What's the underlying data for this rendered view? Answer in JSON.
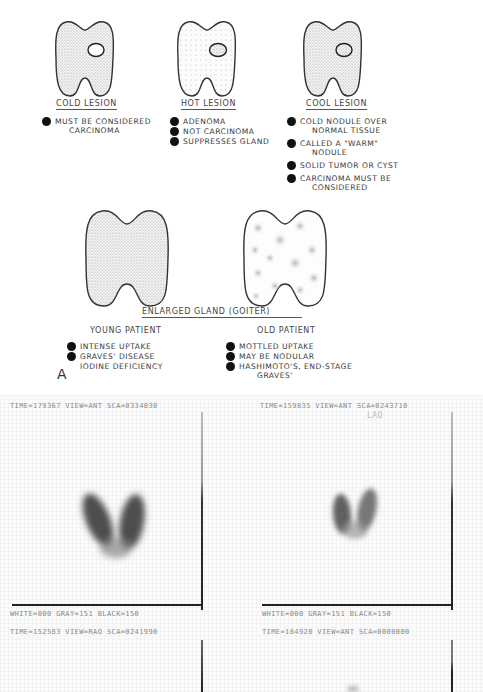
{
  "lesions": [
    {
      "title": "COLD LESION",
      "bullets": [
        {
          "lines": [
            "MUST BE CONSIDERED",
            "CARCINOMA"
          ]
        }
      ]
    },
    {
      "title": "HOT LESION",
      "bullets": [
        {
          "lines": [
            "ADENOMA"
          ]
        },
        {
          "lines": [
            "NOT CARCINOMA"
          ]
        },
        {
          "lines": [
            "SUPPRESSES GLAND"
          ]
        }
      ]
    },
    {
      "title": "COOL LESION",
      "bullets": [
        {
          "lines": [
            "COLD NODULE OVER",
            "NORMAL TISSUE"
          ]
        },
        {
          "lines": [
            "CALLED A \"WARM\"",
            "NODULE"
          ]
        },
        {
          "lines": [
            "SOLID TUMOR OR CYST"
          ]
        },
        {
          "lines": [
            "CARCINOMA MUST BE",
            "CONSIDERED"
          ]
        }
      ]
    }
  ],
  "goiter": {
    "title": "ENLARGED GLAND (GOITER)",
    "young": {
      "label": "YOUNG PATIENT",
      "items": [
        "INTENSE UPTAKE",
        "GRAVES' DISEASE",
        "IODINE DEFICIENCY"
      ],
      "bulleted": [
        true,
        true,
        false
      ]
    },
    "old": {
      "label": "OLD PATIENT",
      "items": [
        "MOTTLED UPTAKE",
        "MAY BE NODULAR",
        "HASHIMOTO'S, END-STAGE"
      ],
      "continuation": "GRAVES'"
    }
  },
  "panel_letter": "A",
  "scans": [
    {
      "header": "TIME=179367 VIEW=ANT SCA=0334030",
      "footer": "WHITE=000    GRAY=151   BLACK=150"
    },
    {
      "header": "TIME=159835 VIEW=ANT SCA=0243710",
      "overlay": "LAO",
      "footer": "WHITE=000    GRAY=151   BLACK=150"
    },
    {
      "header": "TIME=152583 VIEW=RAO SCA=0241990"
    },
    {
      "header": "TIME=184920 VIEW=ANT SCA=0000000"
    }
  ],
  "colors": {
    "ink": "#333333",
    "bullet": "#111111",
    "scan_text": "#888888",
    "uptake": "#3a3a3a"
  }
}
